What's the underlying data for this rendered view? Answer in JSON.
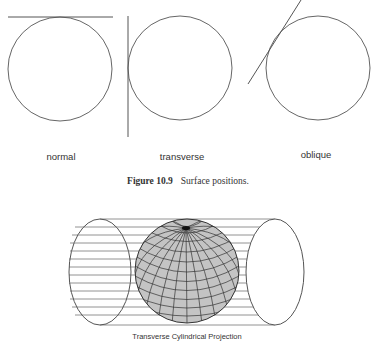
{
  "top_figure": {
    "panels": [
      {
        "id": "normal",
        "label": "normal",
        "circle": {
          "cx": 60,
          "cy": 69,
          "r": 52
        },
        "tangent": {
          "x1": 8,
          "y1": 17,
          "x2": 113,
          "y2": 17
        }
      },
      {
        "id": "transverse",
        "label": "transverse",
        "circle": {
          "cx": 180,
          "cy": 68,
          "r": 52
        },
        "tangent": {
          "x1": 128,
          "y1": 16,
          "x2": 128,
          "y2": 137
        }
      },
      {
        "id": "oblique",
        "label": "oblique",
        "circle": {
          "cx": 318,
          "cy": 68,
          "r": 52
        },
        "tangent": {
          "x1": 248,
          "y1": 84,
          "x2": 301,
          "y2": 0
        }
      }
    ],
    "caption_number": "Figure 10.9",
    "caption_text": "Surface positions."
  },
  "bottom_figure": {
    "title": "Transverse Cylindrical Projection",
    "cylinder": {
      "left_end": {
        "cx": 100,
        "cy": 272,
        "rx": 31,
        "ry": 53
      },
      "right_end": {
        "cx": 275,
        "cy": 272,
        "rx": 29,
        "ry": 53
      },
      "line_spacing": 8
    },
    "globe": {
      "cx": 187,
      "cy": 271,
      "r": 52,
      "fill": "#c4c4c4",
      "grid_color": "#333333"
    }
  },
  "colors": {
    "line": "#555555",
    "text": "#333333",
    "background": "#ffffff"
  }
}
